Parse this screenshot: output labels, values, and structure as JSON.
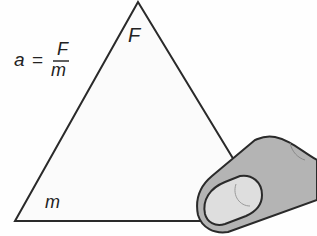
{
  "diagram": {
    "type": "formula-triangle",
    "formula": {
      "lhs": "a",
      "equals": "=",
      "numerator": "F",
      "denominator": "m"
    },
    "triangle": {
      "top_label": "F",
      "bottom_left_label": "m"
    },
    "finger": {
      "covers": "bottom-right corner (a)"
    },
    "colors": {
      "line": "#2a2a2a",
      "finger_fill": "#b4b4b4",
      "nail_fill": "#dedede"
    }
  }
}
